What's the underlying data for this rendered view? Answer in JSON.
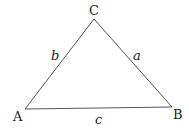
{
  "diagram": {
    "type": "triangle",
    "vertices": [
      {
        "id": "A",
        "label": "A",
        "x": 25,
        "y": 109
      },
      {
        "id": "B",
        "label": "B",
        "x": 172,
        "y": 107
      },
      {
        "id": "C",
        "label": "C",
        "x": 94,
        "y": 19
      }
    ],
    "sides": [
      {
        "id": "a",
        "label": "a",
        "from": "B",
        "to": "C"
      },
      {
        "id": "b",
        "label": "b",
        "from": "A",
        "to": "C"
      },
      {
        "id": "c",
        "label": "c",
        "from": "A",
        "to": "B"
      }
    ],
    "line_color": "#555555"
  }
}
